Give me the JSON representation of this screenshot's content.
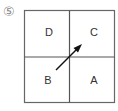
{
  "figure": {
    "number_label": "⑤",
    "quadrants": {
      "top_left": "D",
      "top_right": "C",
      "bottom_left": "B",
      "bottom_right": "A"
    },
    "arrow": {
      "from": "B",
      "to": "C",
      "direction": "up-right"
    },
    "colors": {
      "line": "#555555",
      "arrow": "#111111",
      "text": "#333333"
    }
  }
}
